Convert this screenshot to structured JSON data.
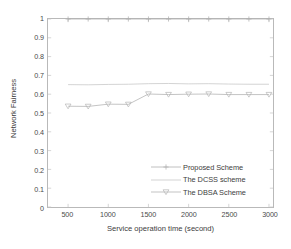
{
  "chart_data": {
    "type": "line",
    "title": "",
    "xlabel": "Service operation time (second)",
    "ylabel": "Network Fairness",
    "xlim": [
      250,
      3050
    ],
    "ylim": [
      0,
      1
    ],
    "xticks": [
      500,
      1000,
      1500,
      2000,
      2500,
      3000
    ],
    "yticks": [
      "0",
      "0.1",
      "0.2",
      "0.3",
      "0.4",
      "0.5",
      "0.6",
      "0.7",
      "0.8",
      "0.9",
      "1"
    ],
    "grid": false,
    "legend_position": "lower right",
    "x": [
      500,
      750,
      1000,
      1250,
      1500,
      1750,
      2000,
      2250,
      2500,
      2750,
      3000
    ],
    "series": [
      {
        "name": "Proposed Scheme",
        "marker": "plus",
        "values": [
          1.0,
          1.0,
          1.0,
          1.0,
          1.0,
          1.0,
          1.0,
          1.0,
          1.0,
          1.0,
          1.0
        ],
        "color": "#b0b0b0"
      },
      {
        "name": "The DCSS scheme",
        "marker": "none",
        "values": [
          0.651,
          0.65,
          0.652,
          0.653,
          0.656,
          0.657,
          0.655,
          0.656,
          0.654,
          0.653,
          0.653
        ],
        "color": "#c8c8c8"
      },
      {
        "name": "The DBSA Scheme",
        "marker": "triangle-down",
        "values": [
          0.536,
          0.535,
          0.547,
          0.546,
          0.601,
          0.598,
          0.6,
          0.601,
          0.598,
          0.598,
          0.598
        ],
        "color": "#b4b4b4"
      }
    ]
  },
  "legend": {
    "items": [
      {
        "label": "Proposed Scheme"
      },
      {
        "label": "The DCSS scheme"
      },
      {
        "label": "The DBSA Scheme"
      }
    ]
  },
  "axes": {
    "x_title": "Service operation time (second)",
    "y_title": "Network Fairness"
  }
}
